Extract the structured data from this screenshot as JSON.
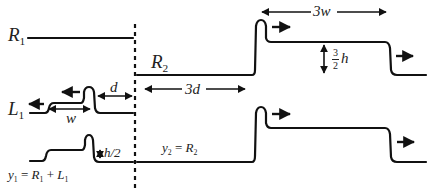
{
  "diagram": {
    "labels": {
      "R1": {
        "base": "R",
        "sub": "1"
      },
      "R2": {
        "base": "R",
        "sub": "2"
      },
      "L1": {
        "base": "L",
        "sub": "1"
      },
      "d": "d",
      "three_d": "3d",
      "w": "w",
      "three_w": "3w",
      "three_halves_h": {
        "num": "3",
        "den": "2",
        "var": "h"
      },
      "h_half": "h/2",
      "y2_eq": {
        "y": "y",
        "y_sub": "2",
        "eq": " = ",
        "R": "R",
        "R_sub": "2"
      },
      "y1_eq": {
        "y": "y",
        "y_sub": "1",
        "eq": " = ",
        "R": "R",
        "R_sub": "1",
        "plus": " + ",
        "L": "L",
        "L_sub": "1"
      }
    },
    "colors": {
      "stroke": "#111111",
      "background": "#ffffff"
    }
  }
}
